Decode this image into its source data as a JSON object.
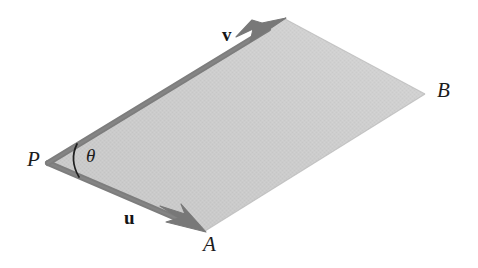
{
  "figure": {
    "type": "geometric-diagram",
    "canvas": {
      "width": 478,
      "height": 268,
      "background": "#ffffff"
    },
    "style": {
      "fill_color": "#c9c9c9",
      "fill_color_light": "#d6d6d6",
      "stroke_color": "#7d7d7d",
      "stroke_dark_color": "#6e6e6e",
      "arc_color": "#1f1f1f",
      "text_color": "#1c1c1c",
      "stroke_width": 5.5,
      "arc_width": 1.6
    },
    "points": {
      "P": {
        "x": 48,
        "y": 163,
        "label": "P"
      },
      "A": {
        "x": 205,
        "y": 231,
        "label": "A"
      },
      "Q": {
        "x": 285,
        "y": 19,
        "label": ""
      },
      "B": {
        "x": 425,
        "y": 94,
        "label": "B"
      }
    },
    "vectors": [
      {
        "name": "u",
        "label": "u",
        "from": "P",
        "to": "A",
        "arrow": "barbed",
        "label_x": 124,
        "label_y": 208
      },
      {
        "name": "v",
        "label": "v",
        "from": "P",
        "to": "Q",
        "arrow": "barbed",
        "label_x": 222,
        "label_y": 25
      }
    ],
    "angle": {
      "label": "θ",
      "vertex": "P",
      "between": [
        "u",
        "v"
      ],
      "label_x": 86,
      "label_y": 146
    },
    "vertex_labels": [
      {
        "id": "P",
        "text": "P",
        "x": 27,
        "y": 149
      },
      {
        "id": "A",
        "text": "A",
        "x": 203,
        "y": 234
      },
      {
        "id": "B",
        "text": "B",
        "x": 437,
        "y": 80
      }
    ]
  }
}
